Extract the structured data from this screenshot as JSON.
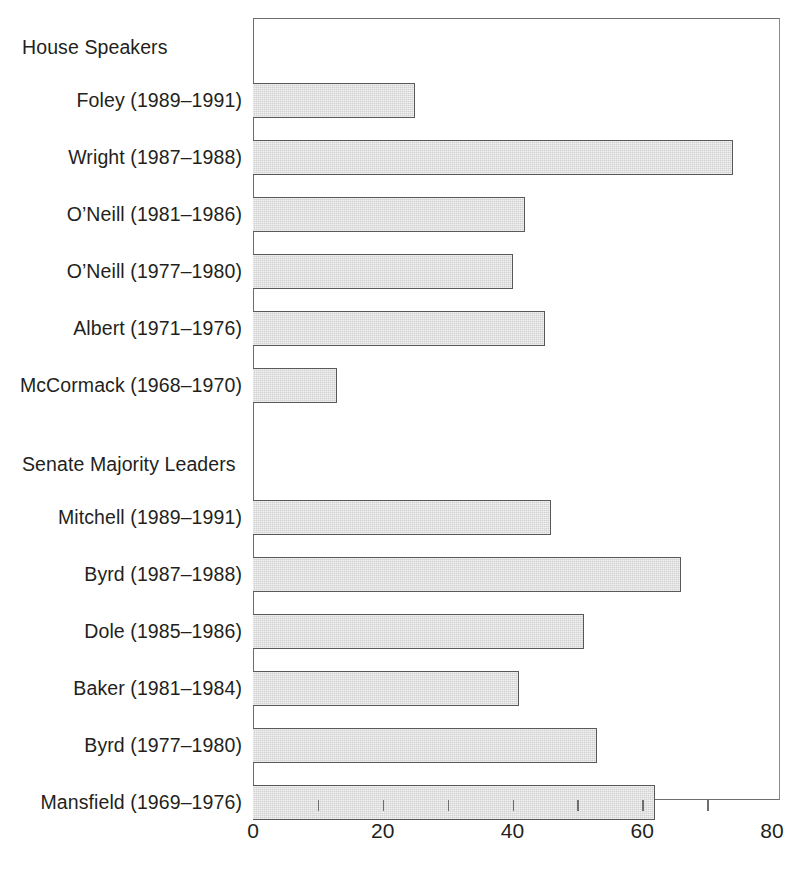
{
  "chart_data": {
    "type": "bar",
    "orientation": "horizontal",
    "title": "",
    "subtitle": "",
    "xlabel": "",
    "ylabel": "",
    "xlim": [
      0,
      80
    ],
    "ylim": null,
    "grid": false,
    "legend": null,
    "bar_color": "#d2d2d2",
    "bar_edge_color": "#58595b",
    "axis_color": "#6d6e71",
    "text_color": "#231f20",
    "xticks": [
      0,
      10,
      20,
      30,
      40,
      50,
      60,
      70,
      80
    ],
    "xtick_labels": [
      "0",
      "",
      "20",
      "",
      "40",
      "",
      "60",
      "",
      "80"
    ],
    "major_xticks": [
      0,
      20,
      40,
      60,
      80
    ],
    "groups": [
      {
        "name": "House Speakers",
        "categories": [
          "Foley (1989–1991)",
          "Wright (1987–1988)",
          "O’Neill (1981–1986)",
          "O’Neill (1977–1980)",
          "Albert (1971–1976)",
          "McCormack (1968–1970)"
        ],
        "values": [
          25,
          74,
          42,
          40,
          45,
          13
        ]
      },
      {
        "name": "Senate Majority Leaders",
        "categories": [
          "Mitchell (1989–1991)",
          "Byrd (1987–1988)",
          "Dole (1985–1986)",
          "Baker (1981–1984)",
          "Byrd (1977–1980)",
          "Mansfield (1969–1976)"
        ],
        "values": [
          46,
          66,
          51,
          41,
          53,
          62
        ]
      }
    ],
    "categories": [
      "Foley (1989–1991)",
      "Wright (1987–1988)",
      "O’Neill (1981–1986)",
      "O’Neill (1977–1980)",
      "Albert (1971–1976)",
      "McCormack (1968–1970)",
      "Mitchell (1989–1991)",
      "Byrd (1987–1988)",
      "Dole (1985–1986)",
      "Baker (1981–1984)",
      "Byrd (1977–1980)",
      "Mansfield (1969–1976)"
    ],
    "values": [
      25,
      74,
      42,
      40,
      45,
      13,
      46,
      66,
      51,
      41,
      53,
      62
    ]
  },
  "labels": {
    "group_house": "House Speakers",
    "group_senate": "Senate Majority Leaders",
    "rows": [
      "Foley (1989–1991)",
      "Wright (1987–1988)",
      "O’Neill (1981–1986)",
      "O’Neill (1977–1980)",
      "Albert (1971–1976)",
      "McCormack (1968–1970)",
      "Mitchell (1989–1991)",
      "Byrd (1987–1988)",
      "Dole (1985–1986)",
      "Baker (1981–1984)",
      "Byrd (1977–1980)",
      "Mansfield (1969–1976)"
    ]
  },
  "axis": {
    "tick_labels": [
      "0",
      "20",
      "40",
      "60",
      "80"
    ]
  }
}
